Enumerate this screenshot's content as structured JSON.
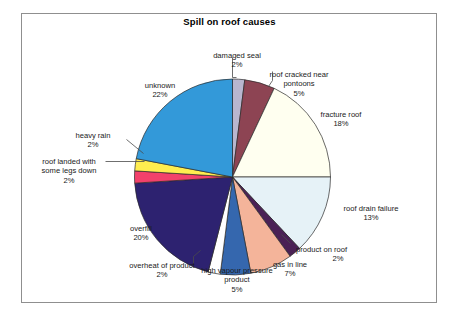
{
  "figure": {
    "title": "Spill on roof causes",
    "frame_color": "#8f8f8f",
    "background": "#ffffff"
  },
  "chart_data": {
    "type": "pie",
    "title": "Spill on roof causes",
    "xlabel": "",
    "ylabel": "",
    "legend": "none",
    "labels_show_percent": true,
    "start_angle_deg": -90,
    "direction": "clockwise",
    "categories": [
      "damaged seal",
      "roof cracked near pontoons",
      "fracture roof",
      "roof drain failure",
      "product on roof",
      "gas in line",
      "high vapour pressure product",
      "overheat of product",
      "overfill",
      "roof landed with some legs down",
      "heavy rain",
      "unknown"
    ],
    "values": [
      2,
      5,
      18,
      13,
      2,
      7,
      5,
      2,
      20,
      2,
      2,
      22
    ],
    "unit": "%",
    "colors": [
      "#b9b6cf",
      "#8d4453",
      "#fffff0",
      "#e6f2f7",
      "#4a2155",
      "#f4b49a",
      "#3567ae",
      "#ffffff",
      "#2d2270",
      "#f2416b",
      "#ffed4f",
      "#3399d9"
    ],
    "slice_edge_color": "#2a2a2a",
    "slices": [
      {
        "label": "damaged seal",
        "value": 2,
        "pct_text": "2%",
        "color": "#b9b6cf"
      },
      {
        "label": "roof cracked near pontoons",
        "value": 5,
        "pct_text": "5%",
        "color": "#8d4453"
      },
      {
        "label": "fracture roof",
        "value": 18,
        "pct_text": "18%",
        "color": "#fffff0"
      },
      {
        "label": "roof drain failure",
        "value": 13,
        "pct_text": "13%",
        "color": "#e6f2f7"
      },
      {
        "label": "product on roof",
        "value": 2,
        "pct_text": "2%",
        "color": "#4a2155"
      },
      {
        "label": "gas in line",
        "value": 7,
        "pct_text": "7%",
        "color": "#f4b49a"
      },
      {
        "label": "high vapour pressure product",
        "value": 5,
        "pct_text": "5%",
        "color": "#3567ae"
      },
      {
        "label": "overheat of product",
        "value": 2,
        "pct_text": "2%",
        "color": "#ffffff"
      },
      {
        "label": "overfill",
        "value": 20,
        "pct_text": "20%",
        "color": "#2d2270"
      },
      {
        "label": "roof landed with some legs down",
        "value": 2,
        "pct_text": "2%",
        "color": "#f2416b"
      },
      {
        "label": "heavy rain",
        "value": 2,
        "pct_text": "2%",
        "color": "#ffed4f"
      },
      {
        "label": "unknown",
        "value": 22,
        "pct_text": "22%",
        "color": "#3399d9"
      }
    ]
  },
  "labels": {
    "damaged_seal": {
      "line1": "damaged seal",
      "pct": "2%"
    },
    "roof_cracked": {
      "line1": "roof cracked near",
      "line2": "pontoons",
      "pct": "5%"
    },
    "fracture_roof": {
      "line1": "fracture roof",
      "pct": "18%"
    },
    "roof_drain": {
      "line1": "roof drain failure",
      "pct": "13%"
    },
    "product_on_roof": {
      "line1": "product on roof",
      "pct": "2%"
    },
    "gas_in_line": {
      "line1": "gas in line",
      "pct": "7%"
    },
    "high_vapour": {
      "line1": "high vapour pressure",
      "line2": "product",
      "pct": "5%"
    },
    "overheat": {
      "line1": "overheat of product",
      "pct": "2%"
    },
    "overfill": {
      "line1": "overfill",
      "pct": "20%"
    },
    "roof_landed": {
      "line1": "roof landed with",
      "line2": "some legs down",
      "pct": "2%"
    },
    "heavy_rain": {
      "line1": "heavy rain",
      "pct": "2%"
    },
    "unknown": {
      "line1": "unknown",
      "pct": "22%"
    }
  }
}
